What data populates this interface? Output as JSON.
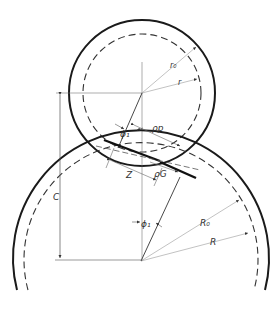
{
  "diagram": {
    "type": "gear mesh geometry",
    "labels": {
      "r0": "r₀",
      "r": "r",
      "rho_p": "ρp",
      "rho_g": "ρG",
      "phi1_top": "ϕ₁",
      "phi1_bottom": "ϕ₁",
      "z": "Z",
      "c": "C",
      "R0": "R₀",
      "R": "R"
    },
    "colors": {
      "line": "#1a1a1a",
      "thin": "#666666",
      "background": "#ffffff"
    },
    "pinion": {
      "cx": 142,
      "cy": 93,
      "outer_radius": 73,
      "pitch_radius": 60
    },
    "gear": {
      "cx": 141,
      "cy": 261,
      "outer_radius": 128,
      "pitch_radius": 117
    }
  }
}
